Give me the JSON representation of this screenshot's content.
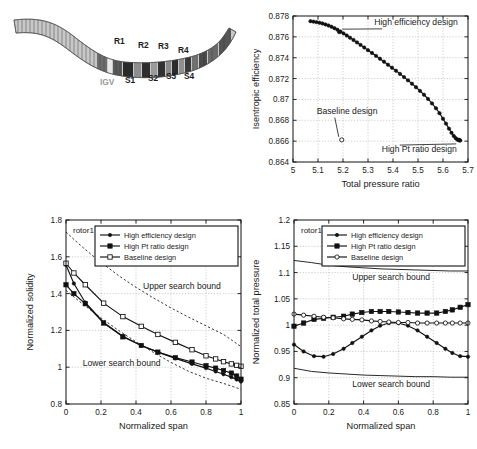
{
  "figure": {
    "panels": [
      "meridional-view",
      "pareto-front",
      "normalized-solidity",
      "normalized-total-pressure"
    ]
  },
  "meridional": {
    "title": "",
    "blade_rows": [
      {
        "name": "IGV",
        "x": 108,
        "y": 178,
        "position": "below"
      },
      {
        "name": "R1",
        "x": 122,
        "y": 137,
        "position": "above"
      },
      {
        "name": "S1",
        "x": 133,
        "y": 176,
        "position": "below"
      },
      {
        "name": "R2",
        "x": 146,
        "y": 141,
        "position": "above"
      },
      {
        "name": "S2",
        "x": 156,
        "y": 174,
        "position": "below"
      },
      {
        "name": "R3",
        "x": 166,
        "y": 142,
        "position": "above"
      },
      {
        "name": "S3",
        "x": 174,
        "y": 172,
        "position": "below"
      },
      {
        "name": "R4",
        "x": 186,
        "y": 146,
        "position": "above"
      },
      {
        "name": "S4",
        "x": 192,
        "y": 172,
        "position": "below"
      }
    ]
  },
  "chart_data": [
    {
      "id": "pareto-front",
      "type": "scatter",
      "title": "",
      "xlabel": "Total pressure ratio",
      "ylabel": "Isentropic efficiency",
      "xlim": [
        5,
        5.7
      ],
      "ylim": [
        0.864,
        0.878
      ],
      "xticks": [
        "5",
        "5.1",
        "5.2",
        "5.3",
        "5.4",
        "5.5",
        "5.6",
        "5.7"
      ],
      "xtickvals": [
        5,
        5.1,
        5.2,
        5.3,
        5.4,
        5.5,
        5.6,
        5.7
      ],
      "yticks": [
        "0.864",
        "0.866",
        "0.868",
        "0.87",
        "0.872",
        "0.874",
        "0.876",
        "0.878"
      ],
      "ytickvals": [
        0.864,
        0.866,
        0.868,
        0.87,
        0.872,
        0.874,
        0.876,
        0.878
      ],
      "grid": true,
      "series": [
        {
          "name": "Pareto front",
          "marker": "filled-dot",
          "x": [
            5.07,
            5.082,
            5.094,
            5.106,
            5.118,
            5.13,
            5.142,
            5.154,
            5.166,
            5.178,
            5.19,
            5.202,
            5.215,
            5.228,
            5.242,
            5.256,
            5.27,
            5.285,
            5.3,
            5.316,
            5.332,
            5.348,
            5.364,
            5.38,
            5.396,
            5.412,
            5.428,
            5.444,
            5.46,
            5.476,
            5.492,
            5.508,
            5.524,
            5.54,
            5.556,
            5.572,
            5.586,
            5.6,
            5.612,
            5.624,
            5.634,
            5.643,
            5.651,
            5.657,
            5.662,
            5.666,
            5.669
          ],
          "y": [
            0.8775,
            0.87746,
            0.87741,
            0.87735,
            0.87728,
            0.87719,
            0.87709,
            0.87697,
            0.87683,
            0.87668,
            0.87651,
            0.87633,
            0.87613,
            0.87592,
            0.8757,
            0.87547,
            0.87523,
            0.87498,
            0.87472,
            0.87445,
            0.87418,
            0.8739,
            0.87362,
            0.87333,
            0.87304,
            0.87275,
            0.87245,
            0.87214,
            0.87183,
            0.87151,
            0.87117,
            0.87082,
            0.87045,
            0.87005,
            0.86962,
            0.86915,
            0.86868,
            0.86815,
            0.86768,
            0.8672,
            0.8668,
            0.8665,
            0.86628,
            0.86616,
            0.8661,
            0.86608,
            0.86606
          ]
        }
      ],
      "points": [
        {
          "name": "High efficiency design",
          "x": 5.185,
          "y": 0.87645,
          "marker": "filled-dot",
          "label": "High efficiency design",
          "label_x": 5.325,
          "label_y": 0.87715
        },
        {
          "name": "Baseline design",
          "x": 5.195,
          "y": 0.86612,
          "marker": "open-circle",
          "label": "Baseline design",
          "label_x": 5.095,
          "label_y": 0.86865
        },
        {
          "name": "High Pt ratio design",
          "x": 5.665,
          "y": 0.86612,
          "marker": "filled-dot",
          "label": "High Pt ratio design",
          "label_x": 5.355,
          "label_y": 0.86495
        }
      ]
    },
    {
      "id": "normalized-solidity",
      "type": "line",
      "title": "rotor1",
      "xlabel": "Normalized span",
      "ylabel": "Normalized solidity",
      "xlim": [
        0,
        1
      ],
      "ylim": [
        0.8,
        1.8
      ],
      "xticks": [
        "0",
        "0.2",
        "0.4",
        "0.6",
        "0.8",
        "1"
      ],
      "xtickvals": [
        0,
        0.2,
        0.4,
        0.6,
        0.8,
        1
      ],
      "yticks": [
        "0.8",
        "1",
        "1.2",
        "1.4",
        "1.6",
        "1.8"
      ],
      "ytickvals": [
        0.8,
        1.0,
        1.2,
        1.4,
        1.6,
        1.8
      ],
      "grid": true,
      "annotations": [
        {
          "text": "Upper search bound",
          "x": 0.44,
          "y": 1.425
        },
        {
          "text": "Lower search bound",
          "x": 0.095,
          "y": 1.005
        }
      ],
      "bounds": [
        {
          "name": "Upper search bound",
          "style": "dashed",
          "x": [
            0,
            0.05,
            0.1,
            0.15,
            0.2,
            0.3,
            0.4,
            0.5,
            0.6,
            0.7,
            0.8,
            0.9,
            1
          ],
          "y": [
            1.735,
            1.69,
            1.648,
            1.608,
            1.57,
            1.498,
            1.434,
            1.376,
            1.322,
            1.272,
            1.225,
            1.178,
            1.112
          ]
        },
        {
          "name": "Lower search bound",
          "style": "dashed",
          "x": [
            0,
            0.05,
            0.1,
            0.15,
            0.2,
            0.3,
            0.4,
            0.5,
            0.6,
            0.7,
            0.8,
            0.9,
            1
          ],
          "y": [
            1.418,
            1.378,
            1.34,
            1.304,
            1.268,
            1.2,
            1.138,
            1.08,
            1.026,
            0.978,
            0.94,
            0.912,
            0.88
          ]
        }
      ],
      "series": [
        {
          "name": "High efficiency design",
          "marker": "filled-dot",
          "x": [
            0,
            0.045,
            0.11,
            0.215,
            0.325,
            0.43,
            0.525,
            0.625,
            0.72,
            0.8,
            0.855,
            0.9,
            0.945,
            0.975,
            1
          ],
          "y": [
            1.555,
            1.455,
            1.352,
            1.243,
            1.168,
            1.118,
            1.082,
            1.048,
            1.018,
            0.995,
            0.977,
            0.962,
            0.946,
            0.933,
            0.922
          ]
        },
        {
          "name": "High Pt ratio design",
          "marker": "filled-square",
          "x": [
            0,
            0.045,
            0.11,
            0.215,
            0.325,
            0.43,
            0.525,
            0.625,
            0.72,
            0.8,
            0.855,
            0.9,
            0.945,
            0.975,
            1
          ],
          "y": [
            1.448,
            1.4,
            1.345,
            1.24,
            1.165,
            1.118,
            1.082,
            1.052,
            1.028,
            1.008,
            0.995,
            0.982,
            0.968,
            0.952,
            0.935
          ]
        },
        {
          "name": "Baseline design",
          "marker": "open-square",
          "x": [
            0,
            0.045,
            0.11,
            0.215,
            0.325,
            0.43,
            0.525,
            0.625,
            0.72,
            0.8,
            0.855,
            0.9,
            0.945,
            0.975,
            1
          ],
          "y": [
            1.565,
            1.512,
            1.448,
            1.348,
            1.275,
            1.222,
            1.178,
            1.135,
            1.095,
            1.062,
            1.045,
            1.03,
            1.018,
            1.01,
            1.005
          ]
        }
      ],
      "legend": {
        "position": "top-right",
        "items": [
          "High efficiency design",
          "High Pt ratio design",
          "Baseline design"
        ]
      }
    },
    {
      "id": "normalized-total-pressure",
      "type": "line",
      "title": "rotor1",
      "xlabel": "Normalized span",
      "ylabel": "Normalized total pressure",
      "xlim": [
        0,
        1
      ],
      "ylim": [
        0.85,
        1.2
      ],
      "xticks": [
        "0",
        "0.2",
        "0.4",
        "0.6",
        "0.8",
        "1"
      ],
      "xtickvals": [
        0,
        0.2,
        0.4,
        0.6,
        0.8,
        1
      ],
      "yticks": [
        "0.85",
        "0.9",
        "0.95",
        "1",
        "1.05",
        "1.1",
        "1.15",
        "1.2"
      ],
      "ytickvals": [
        0.85,
        0.9,
        0.95,
        1.0,
        1.05,
        1.1,
        1.15,
        1.2
      ],
      "grid": true,
      "annotations": [
        {
          "text": "Upper search bound",
          "x": 0.335,
          "y": 1.085
        },
        {
          "text": "Lower search bound",
          "x": 0.335,
          "y": 0.882
        }
      ],
      "bounds": [
        {
          "name": "Upper search bound",
          "style": "solid",
          "x": [
            0,
            0.1,
            0.2,
            0.3,
            0.4,
            0.5,
            0.6,
            0.7,
            0.8,
            0.9,
            1
          ],
          "y": [
            1.123,
            1.119,
            1.114,
            1.111,
            1.109,
            1.107,
            1.106,
            1.105,
            1.104,
            1.103,
            1.103
          ]
        },
        {
          "name": "Lower search bound",
          "style": "solid",
          "x": [
            0,
            0.1,
            0.2,
            0.3,
            0.4,
            0.5,
            0.6,
            0.7,
            0.8,
            0.9,
            1
          ],
          "y": [
            0.918,
            0.912,
            0.909,
            0.907,
            0.905,
            0.904,
            0.903,
            0.902,
            0.902,
            0.901,
            0.901
          ]
        }
      ],
      "series": [
        {
          "name": "High efficiency design",
          "marker": "filled-dot",
          "x": [
            0,
            0.055,
            0.115,
            0.17,
            0.225,
            0.285,
            0.335,
            0.39,
            0.445,
            0.495,
            0.545,
            0.6,
            0.655,
            0.71,
            0.765,
            0.82,
            0.87,
            0.91,
            0.955,
            1
          ],
          "y": [
            0.963,
            0.95,
            0.941,
            0.94,
            0.945,
            0.955,
            0.966,
            0.978,
            0.99,
            0.999,
            1.004,
            1.004,
            0.999,
            0.99,
            0.978,
            0.966,
            0.955,
            0.947,
            0.941,
            0.94
          ]
        },
        {
          "name": "High Pt ratio design",
          "marker": "filled-square",
          "x": [
            0,
            0.055,
            0.115,
            0.17,
            0.225,
            0.285,
            0.335,
            0.39,
            0.445,
            0.495,
            0.545,
            0.6,
            0.655,
            0.71,
            0.765,
            0.82,
            0.87,
            0.91,
            0.955,
            1
          ],
          "y": [
            0.998,
            1.004,
            1.011,
            1.013,
            1.015,
            1.017,
            1.021,
            1.024,
            1.026,
            1.026,
            1.026,
            1.025,
            1.024,
            1.023,
            1.023,
            1.023,
            1.026,
            1.029,
            1.034,
            1.039
          ]
        },
        {
          "name": "Baseline design",
          "marker": "open-circle",
          "x": [
            0,
            0.055,
            0.115,
            0.17,
            0.225,
            0.285,
            0.335,
            0.39,
            0.445,
            0.495,
            0.545,
            0.6,
            0.655,
            0.71,
            0.765,
            0.82,
            0.87,
            0.91,
            0.955,
            1
          ],
          "y": [
            1.021,
            1.019,
            1.017,
            1.015,
            1.014,
            1.012,
            1.011,
            1.01,
            1.008,
            1.007,
            1.006,
            1.005,
            1.005,
            1.004,
            1.004,
            1.004,
            1.004,
            1.004,
            1.004,
            1.004
          ]
        }
      ],
      "legend": {
        "position": "top-right",
        "items": [
          "High efficiency design",
          "High Pt ratio design",
          "Baseline design"
        ]
      }
    }
  ]
}
